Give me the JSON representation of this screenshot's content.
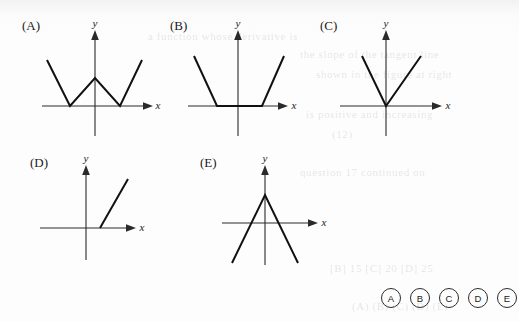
{
  "page": {
    "background_color": "#fdfdfd",
    "ink_color": "#111111",
    "axis_color": "#2a2a2a"
  },
  "figures": [
    {
      "label": "(A)",
      "x_axis_label": "x",
      "y_axis_label": "y",
      "shape": "w-shape",
      "description": "W shape: two V notches with vertices on the x-axis either side of the origin and a peak on the y-axis above the origin"
    },
    {
      "label": "(B)",
      "x_axis_label": "x",
      "y_axis_label": "y",
      "shape": "flat-bottom-u",
      "description": "Flat bottom segment lying along the x-axis spanning the origin, with straight arms rising on both sides"
    },
    {
      "label": "(C)",
      "x_axis_label": "x",
      "y_axis_label": "y",
      "shape": "v-shape",
      "description": "V shape with vertex exactly at the origin and both arms rising"
    },
    {
      "label": "(D)",
      "x_axis_label": "x",
      "y_axis_label": "y",
      "shape": "flat-then-ray",
      "description": "Flat segment along the negative x-axis through the origin, then a ray rising steeply from a point on the positive x-axis"
    },
    {
      "label": "(E)",
      "x_axis_label": "x",
      "y_axis_label": "y",
      "shape": "inverted-v",
      "description": "Inverted V with apex on the positive y-axis and both arms descending below the x-axis"
    }
  ],
  "answer_bubbles": {
    "options": [
      "A",
      "B",
      "C",
      "D",
      "E"
    ]
  },
  "ghost_text": [
    "a function whose derivative is",
    "the slope of the tangent line",
    "shown in the figure at right",
    "is positive and increasing",
    "(12)",
    "(A) (B) (C) (D) (E)",
    "[B] 15    [C] 20    [D] 25",
    "question 17 continued on"
  ]
}
